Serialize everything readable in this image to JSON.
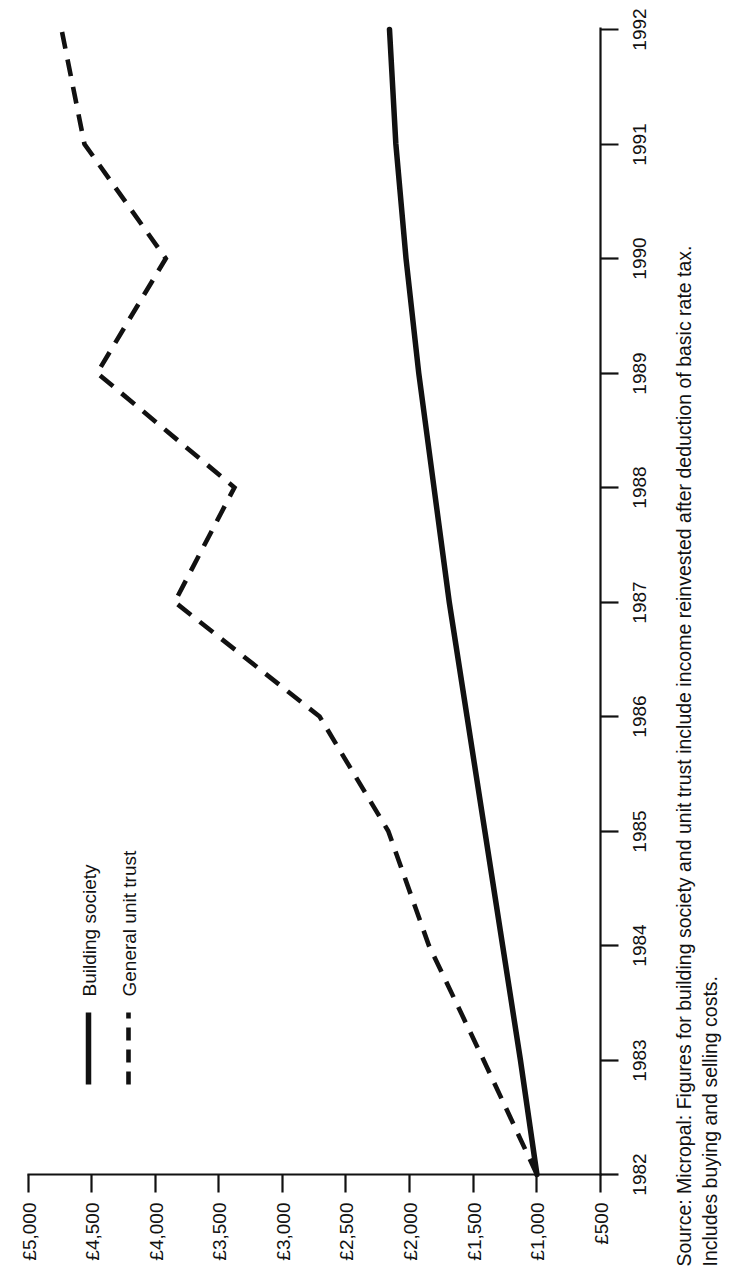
{
  "chart_data": {
    "type": "line",
    "title": "",
    "subtitle": "",
    "xlabel": "",
    "ylabel": "",
    "orientation": "rotated-90-counterclockwise",
    "grid": false,
    "legend_position": "top-left",
    "x": [
      1982,
      1983,
      1984,
      1985,
      1986,
      1987,
      1988,
      1989,
      1990,
      1991,
      1992
    ],
    "xtick_labels": [
      "1982",
      "1983",
      "1984",
      "1985",
      "1986",
      "1987",
      "1988",
      "1989",
      "1990",
      "1991",
      "1992"
    ],
    "xlim": [
      1982,
      1992
    ],
    "ylim": [
      500,
      5000
    ],
    "ytick_labels": [
      "£5,000",
      "£4,500",
      "£4,000",
      "£3,500",
      "£3,000",
      "£2,500",
      "£2,000",
      "£1,500",
      "£1,000",
      "£500"
    ],
    "ytick_values": [
      5000,
      4500,
      4000,
      3500,
      3000,
      2500,
      2000,
      1500,
      1000,
      500
    ],
    "currency_symbol": "£",
    "series": [
      {
        "name": "Building society",
        "style": "solid",
        "color": "#111111",
        "values": [
          1000,
          1130,
          1270,
          1410,
          1550,
          1690,
          1810,
          1930,
          2030,
          2110,
          2160
        ]
      },
      {
        "name": "General unit trust",
        "style": "dashed",
        "color": "#111111",
        "values": [
          1000,
          1420,
          1850,
          2170,
          2710,
          3850,
          3380,
          4460,
          3920,
          4560,
          4740
        ]
      }
    ]
  },
  "legend": {
    "items": [
      {
        "label": "Building society",
        "style": "solid"
      },
      {
        "label": "General unit trust",
        "style": "dashed"
      }
    ]
  },
  "source": {
    "line1": "Source: Micropal: Figures for building society and unit trust include income reinvested after deduction of basic rate tax.",
    "line2": "Includes buying and selling costs."
  }
}
